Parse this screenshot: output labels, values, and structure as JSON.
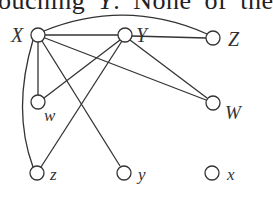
{
  "caption": {
    "fragment_before": "ouching ",
    "italic_var": "Y",
    "fragment_after": ". None of the"
  },
  "graph": {
    "nodes": [
      {
        "id": "X",
        "label": "X",
        "cx": 38,
        "cy": 35
      },
      {
        "id": "Y",
        "label": "Y",
        "cx": 125,
        "cy": 35
      },
      {
        "id": "Z",
        "label": "Z",
        "cx": 213,
        "cy": 38
      },
      {
        "id": "w",
        "label": "w",
        "cx": 38,
        "cy": 102
      },
      {
        "id": "W",
        "label": "W",
        "cx": 213,
        "cy": 103
      },
      {
        "id": "z",
        "label": "z",
        "cx": 37,
        "cy": 173
      },
      {
        "id": "y",
        "label": "y",
        "cx": 124,
        "cy": 173
      },
      {
        "id": "x",
        "label": "x",
        "cx": 212,
        "cy": 173
      }
    ],
    "edges": [
      [
        "X",
        "Y"
      ],
      [
        "X",
        "Z"
      ],
      [
        "X",
        "w"
      ],
      [
        "X",
        "z"
      ],
      [
        "X",
        "y"
      ],
      [
        "X",
        "W"
      ],
      [
        "Y",
        "Z"
      ],
      [
        "Y",
        "w"
      ],
      [
        "Y",
        "z"
      ],
      [
        "Y",
        "W"
      ]
    ]
  }
}
